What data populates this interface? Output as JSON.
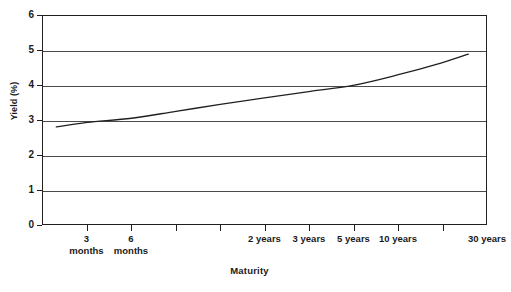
{
  "chart_data": {
    "type": "line",
    "title": "",
    "xlabel": "Maturity",
    "ylabel": "Yield (%)",
    "ylim": [
      0,
      6
    ],
    "yticks": [
      0,
      1,
      2,
      3,
      4,
      5,
      6
    ],
    "ytick_labels": [
      "0",
      "1",
      "2",
      "3",
      "4",
      "5",
      "6"
    ],
    "grid": true,
    "legend": "none",
    "categories": [
      "3\nmonths",
      "6\nmonths",
      "",
      "",
      "2 years",
      "3 years",
      "5 years",
      "10 years",
      "",
      "30 years"
    ],
    "x_tick_labels": [
      {
        "index": 1,
        "label": "3\nmonths"
      },
      {
        "index": 2,
        "label": "6\nmonths"
      },
      {
        "index": 5,
        "label": "2 years"
      },
      {
        "index": 6,
        "label": "3 years"
      },
      {
        "index": 7,
        "label": "5 years"
      },
      {
        "index": 8,
        "label": "10 years"
      },
      {
        "index": 10,
        "label": "30 years"
      }
    ],
    "series": [
      {
        "name": "Yield curve",
        "color": "#231f20",
        "x": [
          0.3,
          1.0,
          2.0,
          3.0,
          4.0,
          5.0,
          6.0,
          7.0,
          8.0,
          9.0,
          9.6
        ],
        "values": [
          2.8,
          2.93,
          3.05,
          3.25,
          3.45,
          3.64,
          3.82,
          4.0,
          4.3,
          4.65,
          4.9
        ]
      }
    ],
    "colors": {
      "axis": "#231f20",
      "gridline": "#4a4a4a",
      "line": "#231f20",
      "background": "#ffffff"
    }
  }
}
